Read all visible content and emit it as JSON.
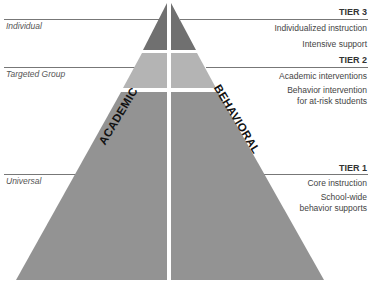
{
  "left_labels": {
    "individual": "Individual",
    "targeted": "Targeted Group",
    "universal": "Universal"
  },
  "halves": {
    "left": "ACADEMIC",
    "right": "BEHAVIORAL"
  },
  "tiers": [
    {
      "title": "TIER 3",
      "lines": [
        "Individualized instruction",
        "Intensive support"
      ],
      "color": "#707070"
    },
    {
      "title": "TIER 2",
      "lines": [
        "Academic interventions",
        "Behavior intervention",
        "for at-risk students"
      ],
      "color": "#b4b4b4"
    },
    {
      "title": "TIER 1",
      "lines": [
        "Core instruction",
        "School-wide",
        "behavior supports"
      ],
      "color": "#939393"
    }
  ]
}
